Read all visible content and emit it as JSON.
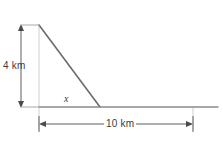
{
  "figure": {
    "type": "geometry-diagram",
    "background_color": "#ffffff",
    "line_color": "#6b6b6b",
    "light_line_color": "#c8c8c8",
    "text_color": "#3c3c3c",
    "labels": {
      "height": "4 km",
      "base": "10 km",
      "angle": "x"
    },
    "geometry": {
      "apex": [
        39,
        25
      ],
      "foot": [
        39,
        107
      ],
      "bottom_vertex": [
        100,
        107
      ],
      "ground_end": [
        218,
        107
      ],
      "vertical_dimension_x": 21,
      "horizontal_dimension_y": 124,
      "horizontal_dimension_start": 39,
      "horizontal_dimension_end": 193
    },
    "measurements": {
      "height_value": 4,
      "height_unit": "km",
      "base_value": 10,
      "base_unit": "km",
      "angle_symbol": "x"
    }
  }
}
